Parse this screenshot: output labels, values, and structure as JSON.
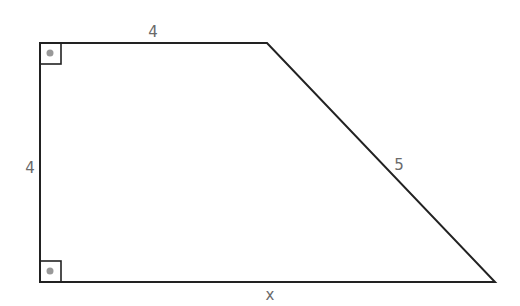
{
  "figure": {
    "type": "right trapezoid",
    "vertices": {
      "top_left": [
        40,
        43
      ],
      "top_right": [
        267,
        43
      ],
      "bottom_right": [
        495,
        282
      ],
      "bottom_left": [
        40,
        282
      ]
    },
    "stroke_color": "#222222",
    "right_angle_marker_color": "#222222",
    "right_angle_dot_color": "#999999"
  },
  "labels": {
    "top": "4",
    "left": "4",
    "slant": "5",
    "bottom": "x"
  },
  "label_color": "#6a6a6a"
}
